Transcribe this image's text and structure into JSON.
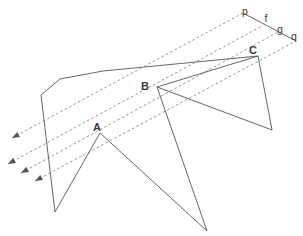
{
  "figure": {
    "background_color": "#ffffff",
    "stroke_color": "#555555",
    "dashed_color": "#8a8a8a",
    "label_color": "#3a3a3a",
    "width": 303,
    "height": 236,
    "vertex_labels": [
      {
        "id": "A",
        "text": "A",
        "x": 97,
        "y": 131
      },
      {
        "id": "B",
        "text": "B",
        "x": 145,
        "y": 90
      },
      {
        "id": "C",
        "text": "C",
        "x": 253,
        "y": 54
      }
    ],
    "line_labels": [
      {
        "id": "p",
        "text": "p",
        "x": 245,
        "y": 15
      },
      {
        "id": "f",
        "text": "f",
        "x": 266,
        "y": 22
      },
      {
        "id": "g",
        "text": "g",
        "x": 280,
        "y": 33
      },
      {
        "id": "q",
        "text": "q",
        "x": 294,
        "y": 40
      }
    ],
    "dashed_rays": [
      {
        "id": "ray-1",
        "x1": 12,
        "y1": 138,
        "x2": 243,
        "y2": 13
      },
      {
        "id": "ray-2",
        "x1": 8,
        "y1": 164,
        "x2": 262,
        "y2": 26
      },
      {
        "id": "ray-3",
        "x1": 21,
        "y1": 173,
        "x2": 280,
        "y2": 31
      },
      {
        "id": "ray-4",
        "x1": 35,
        "y1": 181,
        "x2": 296,
        "y2": 41
      }
    ],
    "arrowheads": [
      {
        "id": "arrow-1",
        "x": 12,
        "y": 138
      },
      {
        "id": "arrow-2",
        "x": 8,
        "y": 164
      },
      {
        "id": "arrow-3",
        "x": 21,
        "y": 173
      },
      {
        "id": "arrow-4",
        "x": 35,
        "y": 181
      }
    ],
    "solid_segment_fg": {
      "id": "segment-p-q",
      "x1": 243,
      "y1": 13,
      "x2": 296,
      "y2": 41
    },
    "polygon_left": {
      "id": "left-polygon",
      "points": "41,95 60,79 103,71 258,56"
    },
    "zigzag_path": {
      "id": "zigzag-path",
      "points": "41,95 55,212 100,133 207,231 157,87 258,56"
    },
    "triangle_right": {
      "id": "right-triangle",
      "points": "258,56 272,130 157,87"
    },
    "triangle_right_edge": {
      "id": "right-triangle-edge",
      "x1": 258,
      "y1": 56,
      "x2": 272,
      "y2": 130
    }
  }
}
